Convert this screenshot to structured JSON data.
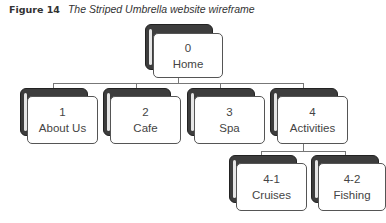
{
  "caption": {
    "number": "Figure 14",
    "title": "The Striped Umbrella website wireframe"
  },
  "nodes": [
    {
      "id": "0",
      "label": "Home"
    },
    {
      "id": "1",
      "label": "About Us"
    },
    {
      "id": "2",
      "label": "Cafe"
    },
    {
      "id": "3",
      "label": "Spa"
    },
    {
      "id": "4",
      "label": "Activities"
    },
    {
      "id": "4-1",
      "label": "Cruises"
    },
    {
      "id": "4-2",
      "label": "Fishing"
    }
  ]
}
